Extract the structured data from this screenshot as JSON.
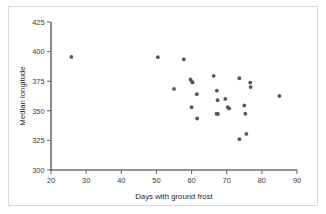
{
  "chart_data": {
    "type": "scatter",
    "title": "",
    "xlabel": "Days with ground frost",
    "ylabel": "Median longitude",
    "xlim": [
      20,
      90
    ],
    "ylim": [
      300,
      425
    ],
    "xticks": [
      20,
      30,
      40,
      50,
      60,
      70,
      80,
      90
    ],
    "yticks": [
      300,
      325,
      350,
      375,
      400,
      425
    ],
    "xtick_labels": [
      "20",
      "30",
      "40",
      "50",
      "60",
      "70",
      "80",
      "90"
    ],
    "ytick_labels": [
      "300",
      "325",
      "350",
      "375",
      "400",
      "425"
    ],
    "grid": false,
    "legend": null,
    "marker": "circle",
    "marker_color": "#55565a",
    "points": [
      {
        "x": 25.8,
        "y": 395.5
      },
      {
        "x": 50.4,
        "y": 395.3
      },
      {
        "x": 57.8,
        "y": 393.5
      },
      {
        "x": 55.0,
        "y": 368.5
      },
      {
        "x": 59.7,
        "y": 376.5
      },
      {
        "x": 60.1,
        "y": 374.5
      },
      {
        "x": 60.3,
        "y": 374.0
      },
      {
        "x": 60.0,
        "y": 353.0
      },
      {
        "x": 61.5,
        "y": 364.0
      },
      {
        "x": 61.6,
        "y": 343.5
      },
      {
        "x": 66.3,
        "y": 379.5
      },
      {
        "x": 67.2,
        "y": 367.0
      },
      {
        "x": 67.4,
        "y": 359.0
      },
      {
        "x": 67.1,
        "y": 347.5
      },
      {
        "x": 67.5,
        "y": 347.3
      },
      {
        "x": 69.6,
        "y": 360.0
      },
      {
        "x": 70.3,
        "y": 353.0
      },
      {
        "x": 70.7,
        "y": 352.0
      },
      {
        "x": 73.6,
        "y": 377.5
      },
      {
        "x": 73.6,
        "y": 326.0
      },
      {
        "x": 75.0,
        "y": 354.5
      },
      {
        "x": 75.3,
        "y": 347.5
      },
      {
        "x": 75.6,
        "y": 330.5
      },
      {
        "x": 76.7,
        "y": 373.8
      },
      {
        "x": 76.8,
        "y": 370.0
      },
      {
        "x": 85.0,
        "y": 362.5
      }
    ],
    "point_count": 26
  },
  "figure": {
    "background_color": "#ffffff",
    "border_color": "#d9d9d9",
    "axis_color": "#6e6e6e"
  }
}
